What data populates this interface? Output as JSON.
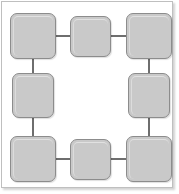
{
  "diagram": {
    "type": "ring-topology-diagram",
    "canvas": {
      "width": 179,
      "height": 194
    },
    "colors": {
      "node_fill": "#c9c9c9",
      "node_border": "#8c8c8c",
      "edge": "#6e6e6e",
      "frame_border": "#bfbfbf",
      "background": "#ffffff"
    },
    "frame": {
      "x": 1,
      "y": 1,
      "width": 172,
      "height": 187,
      "border_width": 1
    },
    "nodes": [
      {
        "id": "node-top-left",
        "label": "",
        "position": "top-left",
        "x": 10,
        "y": 13,
        "width": 46,
        "height": 46
      },
      {
        "id": "node-top-center",
        "label": "",
        "position": "top-center",
        "x": 70,
        "y": 16,
        "width": 41,
        "height": 41
      },
      {
        "id": "node-top-right",
        "label": "",
        "position": "top-right",
        "x": 126,
        "y": 13,
        "width": 46,
        "height": 46
      },
      {
        "id": "node-middle-left",
        "label": "",
        "position": "middle-left",
        "x": 12,
        "y": 73,
        "width": 42,
        "height": 45
      },
      {
        "id": "node-middle-right",
        "label": "",
        "position": "middle-right",
        "x": 128,
        "y": 73,
        "width": 42,
        "height": 45
      },
      {
        "id": "node-bottom-left",
        "label": "",
        "position": "bottom-left",
        "x": 10,
        "y": 136,
        "width": 46,
        "height": 46
      },
      {
        "id": "node-bottom-center",
        "label": "",
        "position": "bottom-center",
        "x": 70,
        "y": 139,
        "width": 41,
        "height": 41
      },
      {
        "id": "node-bottom-right",
        "label": "",
        "position": "bottom-right",
        "x": 126,
        "y": 136,
        "width": 46,
        "height": 46
      }
    ],
    "edges": [
      {
        "id": "edge-top-left--top-center",
        "from": "node-top-left",
        "to": "node-top-center",
        "orientation": "horizontal",
        "x": 55,
        "y": 35,
        "length": 16
      },
      {
        "id": "edge-top-center--top-right",
        "from": "node-top-center",
        "to": "node-top-right",
        "orientation": "horizontal",
        "x": 110,
        "y": 35,
        "length": 17
      },
      {
        "id": "edge-top-left--middle-left",
        "from": "node-top-left",
        "to": "node-middle-left",
        "orientation": "vertical",
        "x": 32,
        "y": 58,
        "length": 16
      },
      {
        "id": "edge-top-right--middle-right",
        "from": "node-top-right",
        "to": "node-middle-right",
        "orientation": "vertical",
        "x": 148,
        "y": 58,
        "length": 16
      },
      {
        "id": "edge-middle-left--bottom-left",
        "from": "node-middle-left",
        "to": "node-bottom-left",
        "orientation": "vertical",
        "x": 32,
        "y": 117,
        "length": 20
      },
      {
        "id": "edge-middle-right--bottom-right",
        "from": "node-middle-right",
        "to": "node-bottom-right",
        "orientation": "vertical",
        "x": 148,
        "y": 117,
        "length": 20
      },
      {
        "id": "edge-bottom-left--bottom-center",
        "from": "node-bottom-left",
        "to": "node-bottom-center",
        "orientation": "horizontal",
        "x": 55,
        "y": 158,
        "length": 16
      },
      {
        "id": "edge-bottom-center--bottom-right",
        "from": "node-bottom-center",
        "to": "node-bottom-right",
        "orientation": "horizontal",
        "x": 110,
        "y": 158,
        "length": 17
      }
    ]
  }
}
